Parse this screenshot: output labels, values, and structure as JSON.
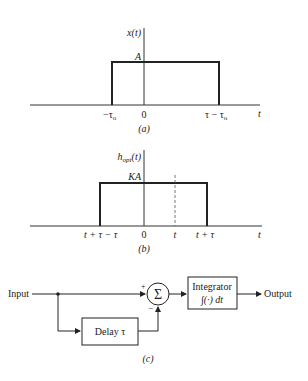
{
  "figure_a": {
    "caption": "(a)",
    "y_label": "x(t)",
    "amplitude_label": "A",
    "x_axis_label": "t",
    "ticks": [
      "−τ",
      "0",
      "τ − τ"
    ],
    "tick_subscripts": [
      "o",
      "",
      "o"
    ]
  },
  "figure_b": {
    "caption": "(b)",
    "y_label_main": "h",
    "y_label_sub": "opt",
    "y_label_arg": "(t)",
    "amplitude_label": "KA",
    "x_axis_label": "t",
    "tick_left": "t + τ − τ",
    "tick_zero": "0",
    "tick_to": "t",
    "tick_right": "t + τ"
  },
  "figure_c": {
    "caption": "(c)",
    "input_label": "Input",
    "output_label": "Output",
    "sum_symbol": "Σ",
    "plus_sign": "+",
    "minus_sign": "−",
    "delay_label": "Delay τ",
    "integrator_title": "Integrator",
    "integrator_formula": "∫(·) dt"
  }
}
